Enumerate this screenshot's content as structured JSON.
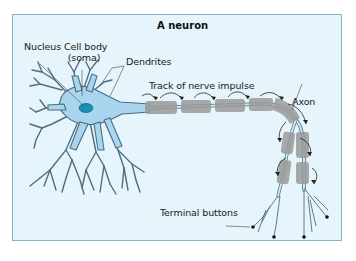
{
  "figure": {
    "title": "A neuron",
    "labels": {
      "nucleus": "Nucleus",
      "cell_body_line1": "Cell body",
      "cell_body_line2": "(soma)",
      "dendrites": "Dendrites",
      "track": "Track of nerve impulse",
      "axon": "Axon",
      "terminal_buttons": "Terminal buttons"
    },
    "colors": {
      "background": "#e6f4fb",
      "border": "#7fb6c8",
      "cell_fill": "#a9d6ee",
      "cell_outline": "#4f6f80",
      "nucleus": "#1d8fb3",
      "myelin": "#9a9a9a",
      "axon_core": "#cfe9f7"
    }
  }
}
